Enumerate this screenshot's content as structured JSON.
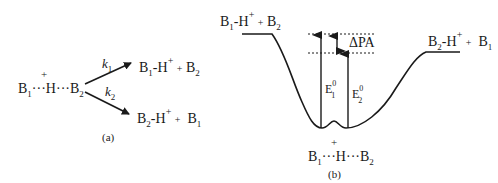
{
  "panel_a": {
    "caption": "(a)",
    "reactant": {
      "b1": "B",
      "b1_sub": "1",
      "dots1": "···",
      "h": "H",
      "h_charge": "+",
      "dots2": "···",
      "b2": "B",
      "b2_sub": "2"
    },
    "rate_1": {
      "k": "k",
      "sub": "1"
    },
    "rate_2": {
      "k": "k",
      "sub": "2"
    },
    "product_1": {
      "b": "B",
      "b_sub": "1",
      "bond": "-",
      "h": "H",
      "h_charge": "+",
      "plus": "+",
      "other": "B",
      "other_sub": "2"
    },
    "product_2": {
      "b": "B",
      "b_sub": "2",
      "bond": "-",
      "h": "H",
      "h_charge": "+",
      "plus": "+",
      "other": "B",
      "other_sub": "1"
    }
  },
  "panel_b": {
    "caption": "(b)",
    "left_state": {
      "b": "B",
      "b_sub": "1",
      "bond": "-",
      "h": "H",
      "h_charge": "+",
      "plus": "+",
      "other": "B",
      "other_sub": "2"
    },
    "right_state": {
      "b": "B",
      "b_sub": "2",
      "bond": "-",
      "h": "H",
      "h_charge": "+",
      "plus": "+",
      "other": "B",
      "other_sub": "1"
    },
    "well_state": {
      "b1": "B",
      "b1_sub": "1",
      "dots1": "···",
      "h": "H",
      "h_charge": "+",
      "dots2": "···",
      "b2": "B",
      "b2_sub": "2"
    },
    "delta_label": "ΔPA",
    "e1": {
      "e": "E",
      "sup": "0",
      "sub": "1"
    },
    "e2": {
      "e": "E",
      "sup": "0",
      "sub": "2"
    }
  }
}
